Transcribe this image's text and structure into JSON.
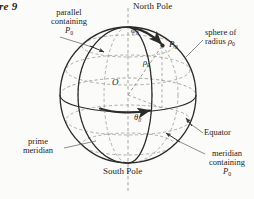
{
  "figure": {
    "number_label": "re 9",
    "caption_note": "Spherical coordinate system on a sphere"
  },
  "colors": {
    "page_background": "#fbfbf9",
    "outline_stroke": "#2b2b2b",
    "dashed_grid": "#9a9a9a",
    "leader_line": "#6e6e6e",
    "text": "#1b1b1b",
    "arrow_fill": "#2b2b2b"
  },
  "geometry": {
    "sphere_center": {
      "x": 128,
      "y": 95
    },
    "sphere_radius": 68,
    "point_P0": {
      "x": 163,
      "y": 45
    },
    "north_pole": {
      "x": 128,
      "y": 27
    },
    "south_pole": {
      "x": 128,
      "y": 163
    }
  },
  "labels": {
    "north_pole": "North Pole",
    "south_pole": "South Pole",
    "equator": "Equator",
    "prime_meridian_line1": "prime",
    "prime_meridian_line2": "meridian",
    "parallel_line1": "parallel",
    "parallel_line2": "containing",
    "parallel_line3": "P",
    "parallel_sub": "0",
    "sphere_of_line1": "sphere of",
    "sphere_of_line2_pre": "radius ",
    "sphere_of_line2_sym": "ρ",
    "sphere_of_line2_sub": "0",
    "meridian_line1": "meridian",
    "meridian_line2": "containing",
    "meridian_line3": "P",
    "meridian_sub": "0"
  },
  "symbols": {
    "point_label": "P",
    "point_sub": "0",
    "origin": "O",
    "phi": "φ",
    "phi_sub": "0",
    "theta": "θ",
    "theta_sub": "0",
    "rho": "ρ",
    "rho_sub": "0"
  }
}
